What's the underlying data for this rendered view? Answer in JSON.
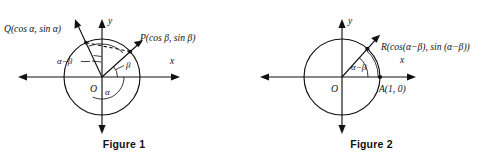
{
  "figures": [
    {
      "id": "figure-1",
      "caption": "Figure 1",
      "axis_x_label": "x",
      "axis_y_label": "y",
      "origin_label": "O",
      "points": [
        {
          "name": "Q",
          "label": "Q(cos α, sin α)",
          "angle_deg": 115,
          "on_circle": true
        },
        {
          "name": "P",
          "label": "P(cos β, sin β)",
          "angle_deg": 42,
          "on_circle": true
        }
      ],
      "angles": [
        {
          "name": "alpha",
          "label": "α",
          "from_deg": 0,
          "to_deg": 115
        },
        {
          "name": "beta",
          "label": "β",
          "from_deg": 0,
          "to_deg": 42
        },
        {
          "name": "alpha-minus-beta",
          "label": "α−β",
          "from_deg": 42,
          "to_deg": 115
        }
      ],
      "chord": {
        "from": "Q",
        "to": "P",
        "style": "dashed"
      }
    },
    {
      "id": "figure-2",
      "caption": "Figure 2",
      "axis_x_label": "x",
      "axis_y_label": "y",
      "origin_label": "O",
      "points": [
        {
          "name": "R",
          "label": "R(cos(α−β), sin (α−β))",
          "angle_deg": 48,
          "on_circle": true
        },
        {
          "name": "A",
          "label": "A(1, 0)",
          "angle_deg": 0,
          "on_circle": true
        }
      ],
      "angles": [
        {
          "name": "alpha-minus-beta",
          "label": "α−β",
          "from_deg": 0,
          "to_deg": 48
        }
      ],
      "chord": null
    }
  ],
  "geometry": {
    "figure_1": {
      "origin_x": 102,
      "origin_y": 77,
      "radius": 38
    },
    "figure_2": {
      "origin_x": 94,
      "origin_y": 77,
      "radius": 38
    }
  },
  "colors": {
    "ink": "#111111",
    "background": "#ffffff"
  }
}
